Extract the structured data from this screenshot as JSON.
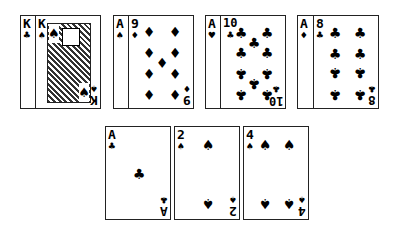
{
  "groups": [
    {
      "back": {
        "rank": "K",
        "suit": "♣"
      },
      "front": {
        "rank": "K",
        "suit": "♠",
        "type": "face"
      }
    },
    {
      "back": {
        "rank": "A",
        "suit": "♠"
      },
      "front": {
        "rank": "9",
        "suit": "♦"
      }
    },
    {
      "back": {
        "rank": "A",
        "suit": "♥"
      },
      "front": {
        "rank": "10",
        "suit": "♣"
      }
    },
    {
      "back": {
        "rank": "A",
        "suit": "♦"
      },
      "front": {
        "rank": "8",
        "suit": "♣"
      }
    }
  ],
  "bottom": [
    {
      "rank": "A",
      "suit": "♣"
    },
    {
      "rank": "2",
      "suit": "♠"
    },
    {
      "rank": "4",
      "suit": "♠"
    }
  ]
}
